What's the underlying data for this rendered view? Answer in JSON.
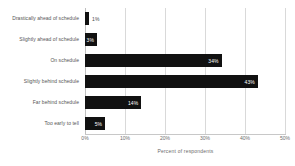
{
  "chart_data": {
    "type": "bar",
    "orientation": "horizontal",
    "title": "",
    "xlabel": "Percent of respondents",
    "ylabel": "",
    "categories": [
      "Drastically ahead of schedule",
      "Slightly ahead of schedule",
      "On schedule",
      "Slightly behind schedule",
      "Far behind schedule",
      "Too early to tell"
    ],
    "values": [
      1,
      3,
      34,
      43,
      14,
      5
    ],
    "value_labels": [
      "1%",
      "3%",
      "34%",
      "43%",
      "14%",
      "5%"
    ],
    "label_placement": [
      "outside",
      "inside",
      "inside",
      "inside",
      "inside",
      "inside"
    ],
    "xlim": [
      0,
      50
    ],
    "xticks": [
      0,
      10,
      20,
      30,
      40,
      50
    ],
    "xtick_labels": [
      "0%",
      "10%",
      "20%",
      "30%",
      "40%",
      "50%"
    ],
    "grid": true,
    "legend": "none",
    "bar_color": "#111111",
    "grid_color": "#d9d9d9",
    "axis_text_color": "#6b6b6b",
    "background": "#ffffff"
  }
}
